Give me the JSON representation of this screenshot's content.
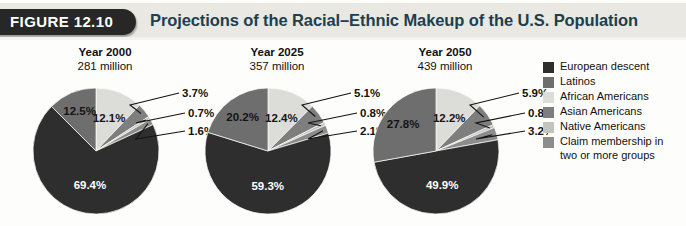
{
  "header": {
    "figure_tab": "FIGURE 12.10",
    "title": "Projections of the Racial–Ethnic Makeup of the U.S. Population",
    "tab_bg": "#272727",
    "band_bg": "#e9e8e3",
    "title_color": "#1d3f4e"
  },
  "legend": {
    "items": [
      {
        "label": "European descent",
        "color": "#2e2e2e"
      },
      {
        "label": "Latinos",
        "color": "#6e6e6e"
      },
      {
        "label": "African Americans",
        "color": "#dcdcd8"
      },
      {
        "label": "Asian Americans",
        "color": "#7e7e7e"
      },
      {
        "label": "Native Americans",
        "color": "#c3c3c0"
      },
      {
        "label": "Claim membership in",
        "label2": "two or more groups",
        "color": "#8c8c8c"
      }
    ]
  },
  "chart_data": {
    "type": "pie",
    "title": "Projections of the Racial–Ethnic Makeup of the U.S. Population",
    "legend_position": "right",
    "categories": [
      "African Americans",
      "Asian Americans",
      "Native Americans",
      "Claim membership in two or more groups",
      "European descent",
      "Latinos"
    ],
    "category_colors": [
      "#dcdcd8",
      "#7e7e7e",
      "#c3c3c0",
      "#8c8c8c",
      "#2e2e2e",
      "#6e6e6e"
    ],
    "charts": [
      {
        "title": "Year 2000",
        "subtitle": "281 million",
        "year": "2000",
        "population": "281 million",
        "values": [
          12.1,
          3.7,
          0.7,
          1.6,
          69.4,
          12.5
        ],
        "labels": [
          "12.1%",
          "3.7%",
          "0.7%",
          "1.6%",
          "69.4%",
          "12.5%"
        ]
      },
      {
        "title": "Year 2025",
        "subtitle": "357 million",
        "year": "2025",
        "population": "357 million",
        "values": [
          12.4,
          5.1,
          0.8,
          2.1,
          59.3,
          20.2
        ],
        "labels": [
          "12.4%",
          "5.1%",
          "0.8%",
          "2.1%",
          "59.3%",
          "20.2%"
        ]
      },
      {
        "title": "Year 2050",
        "subtitle": "439 million",
        "year": "2050",
        "population": "439 million",
        "values": [
          12.2,
          5.9,
          0.8,
          3.2,
          49.9,
          27.8
        ],
        "labels": [
          "12.2%",
          "5.9%",
          "0.8%",
          "3.2%",
          "49.9%",
          "27.8%"
        ]
      }
    ]
  }
}
